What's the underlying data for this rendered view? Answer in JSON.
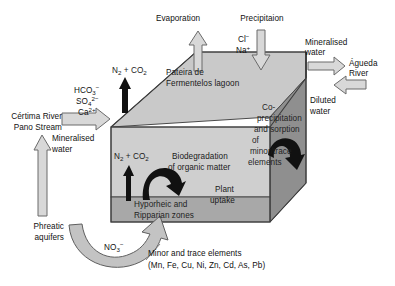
{
  "diagram": {
    "type": "process-diagram",
    "colors": {
      "box_top": "#c9c9c9",
      "box_front": "#cfcfcf",
      "box_front_lower": "#a8a8a8",
      "box_side": "#8f8f8f",
      "arrow_fill": "#d8d8d8",
      "arrow_stroke": "#6b6b6b",
      "curved_arrow_dark": "#1a1a1a",
      "outline": "#444444",
      "text": "#111111"
    },
    "body_labels": {
      "lagoon_name_line1": "Pateira de",
      "lagoon_name_line2": "Fermentelos lagoon",
      "biodegradation_line1": "Biodegradation",
      "biodegradation_line2": "of organic matter",
      "gas_top": "N",
      "gas_top_full": "N2 + CO2",
      "gas_mid_full": "N2 + CO2",
      "hyporheic_line1": "Hyporheic and",
      "hyporheic_line2": "Ripparian zones",
      "plant_uptake_line1": "Plant",
      "plant_uptake_line2": "uptake",
      "coprecip_line1": "Co-",
      "coprecip_line2": "precipitation",
      "coprecip_line3": "and sorption",
      "coprecip_line4": "of",
      "coprecip_line5": "minor/trace",
      "coprecip_line6": "elements"
    },
    "flux_labels": {
      "evaporation": "Evaporation",
      "precipitation": "Precipitaion",
      "precip_ion_1": "Cl",
      "precip_ion_1_charge": "−",
      "precip_ion_2": "Na",
      "precip_ion_2_charge": "+",
      "mineralised_water_right_line1": "Mineralised",
      "mineralised_water_right_line2": "water",
      "agueda_river_line1": "Águeda",
      "agueda_river_line2": "River",
      "diluted_water_line1": "Diluted",
      "diluted_water_line2": "water",
      "certima_river_line1": "Cértima River",
      "certima_river_line2": "Pano Stream",
      "mineralised_water_left_line1": "Mineralised",
      "mineralised_water_left_line2": "water",
      "phreatic_aquifers_line1": "Phreatic",
      "phreatic_aquifers_line2": "aquifers",
      "nitrate": "NO",
      "nitrate_sub": "3",
      "nitrate_charge": "−",
      "inflow_ion_1": "HCO",
      "inflow_ion_1_sub": "3",
      "inflow_ion_1_charge": "−",
      "inflow_ion_2": "SO",
      "inflow_ion_2_sub": "4",
      "inflow_ion_2_charge": "2−",
      "inflow_ion_3": "Ca",
      "inflow_ion_3_charge": "2+"
    },
    "caption": {
      "line1": "Minor and trace elements",
      "line2": "(Mn, Fe, Cu, Ni, Zn, Cd, As, Pb)"
    },
    "gas_species": {
      "n2": "N",
      "n2_sub": "2",
      "plus": " + ",
      "co2": "CO",
      "co2_sub": "2"
    }
  }
}
